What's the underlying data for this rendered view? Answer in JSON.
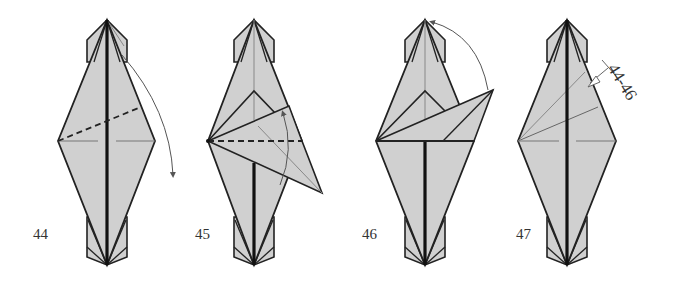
{
  "diagram": {
    "paper_color": "#d0d0d0",
    "line_color": "#222222",
    "crease_color": "#8a8a8a",
    "steps": [
      {
        "number": "44",
        "instruction": "Valley fold the upper layer down along the dashed line",
        "symbols": [
          "valley-fold-line",
          "fold-arrow"
        ]
      },
      {
        "number": "45",
        "instruction": "Valley fold the flap back up",
        "symbols": [
          "valley-fold-line",
          "fold-arrow"
        ]
      },
      {
        "number": "46",
        "instruction": "Fold the flap up to the top point",
        "symbols": [
          "fold-arrow"
        ]
      },
      {
        "number": "47",
        "instruction": "Repeat steps 44-46",
        "symbols": [
          "repeat-arrow"
        ],
        "repeat_label": "44-46"
      }
    ]
  }
}
